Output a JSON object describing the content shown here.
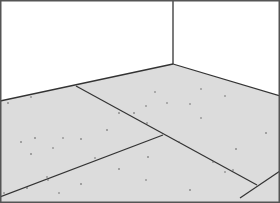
{
  "scene": {
    "description": "Line drawing of an empty room corner with speckled floor planks",
    "colors": {
      "wall": "#ffffff",
      "floor": "#dcdcdc",
      "line": "#333333",
      "border": "#555555",
      "speck": "#555555"
    }
  }
}
